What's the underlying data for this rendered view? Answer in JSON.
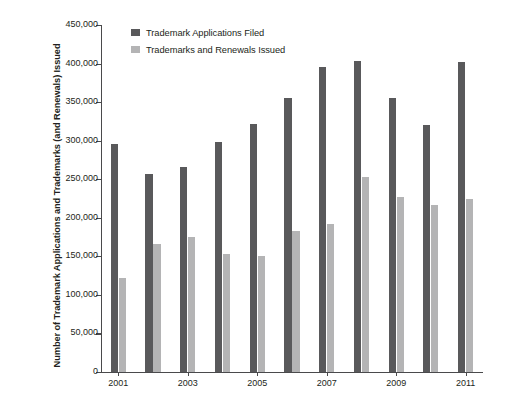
{
  "chart_data": {
    "type": "bar",
    "title": "",
    "xlabel": "",
    "ylabel": "Number of Trademark Applications and Trademarks (and Renewals) Issued",
    "ylim": [
      0,
      450000
    ],
    "grid": false,
    "legend_position": "top-left",
    "categories": [
      "2001",
      "2002",
      "2003",
      "2004",
      "2005",
      "2006",
      "2007",
      "2008",
      "2009",
      "2010",
      "2011"
    ],
    "tick_labels_x": [
      "2001",
      "2003",
      "2005",
      "2007",
      "2009",
      "2011"
    ],
    "tick_labels_y": [
      "0",
      "50,000",
      "100,000",
      "150,000",
      "200,000",
      "250,000",
      "300,000",
      "350,000",
      "400,000",
      "450,000"
    ],
    "tick_values_y": [
      0,
      50000,
      100000,
      150000,
      200000,
      250000,
      300000,
      350000,
      400000,
      450000
    ],
    "series": [
      {
        "name": "Trademark Applications Filed",
        "color": "#59595b",
        "values": [
          296000,
          257000,
          266000,
          298000,
          322000,
          355000,
          395000,
          403000,
          355000,
          320000,
          402000
        ]
      },
      {
        "name": "Trademarks and Renewals Issued",
        "color": "#b4b4b5",
        "values": [
          122000,
          166000,
          175000,
          153000,
          151000,
          183000,
          192000,
          253000,
          227000,
          216000,
          224000
        ]
      }
    ]
  }
}
